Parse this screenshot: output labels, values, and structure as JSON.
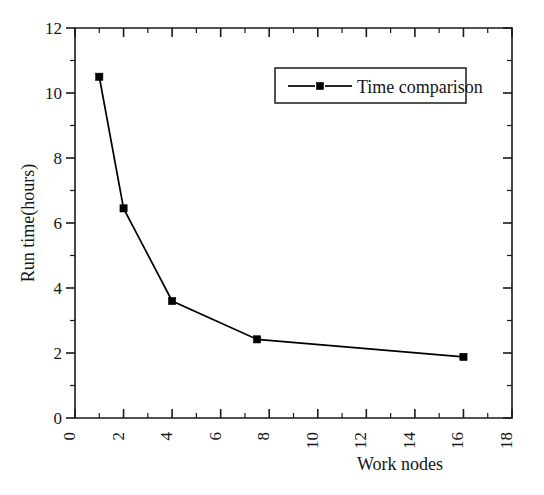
{
  "chart_data": {
    "type": "line",
    "title": "",
    "xlabel": "Work nodes",
    "ylabel": "Run time(hours)",
    "xlim": [
      0,
      18
    ],
    "ylim": [
      0,
      12
    ],
    "x_major_ticks": [
      0,
      2,
      4,
      6,
      8,
      10,
      12,
      14,
      16,
      18
    ],
    "x_minor_ticks": [
      1,
      3,
      5,
      7,
      9,
      11,
      13,
      15,
      17
    ],
    "y_major_ticks": [
      0,
      2,
      4,
      6,
      8,
      10,
      12
    ],
    "y_minor_ticks": [
      1,
      3,
      5,
      7,
      9,
      11
    ],
    "x_tick_labels": [
      "0",
      "2",
      "4",
      "6",
      "8",
      "10",
      "12",
      "14",
      "16",
      "18"
    ],
    "y_tick_labels": [
      "0",
      "2",
      "4",
      "6",
      "8",
      "10",
      "12"
    ],
    "grid": false,
    "legend_position": "top-right",
    "series": [
      {
        "name": "Time comparison",
        "marker": "square",
        "color": "#000000",
        "x": [
          1.0,
          2.0,
          4.0,
          7.5,
          16.0
        ],
        "values": [
          10.5,
          6.45,
          3.6,
          2.42,
          1.88
        ]
      }
    ]
  },
  "legend": {
    "entries": [
      {
        "label": "Time comparison"
      }
    ]
  },
  "axes": {
    "x_axis_title": "Work nodes",
    "y_axis_title": "Run time(hours)"
  }
}
